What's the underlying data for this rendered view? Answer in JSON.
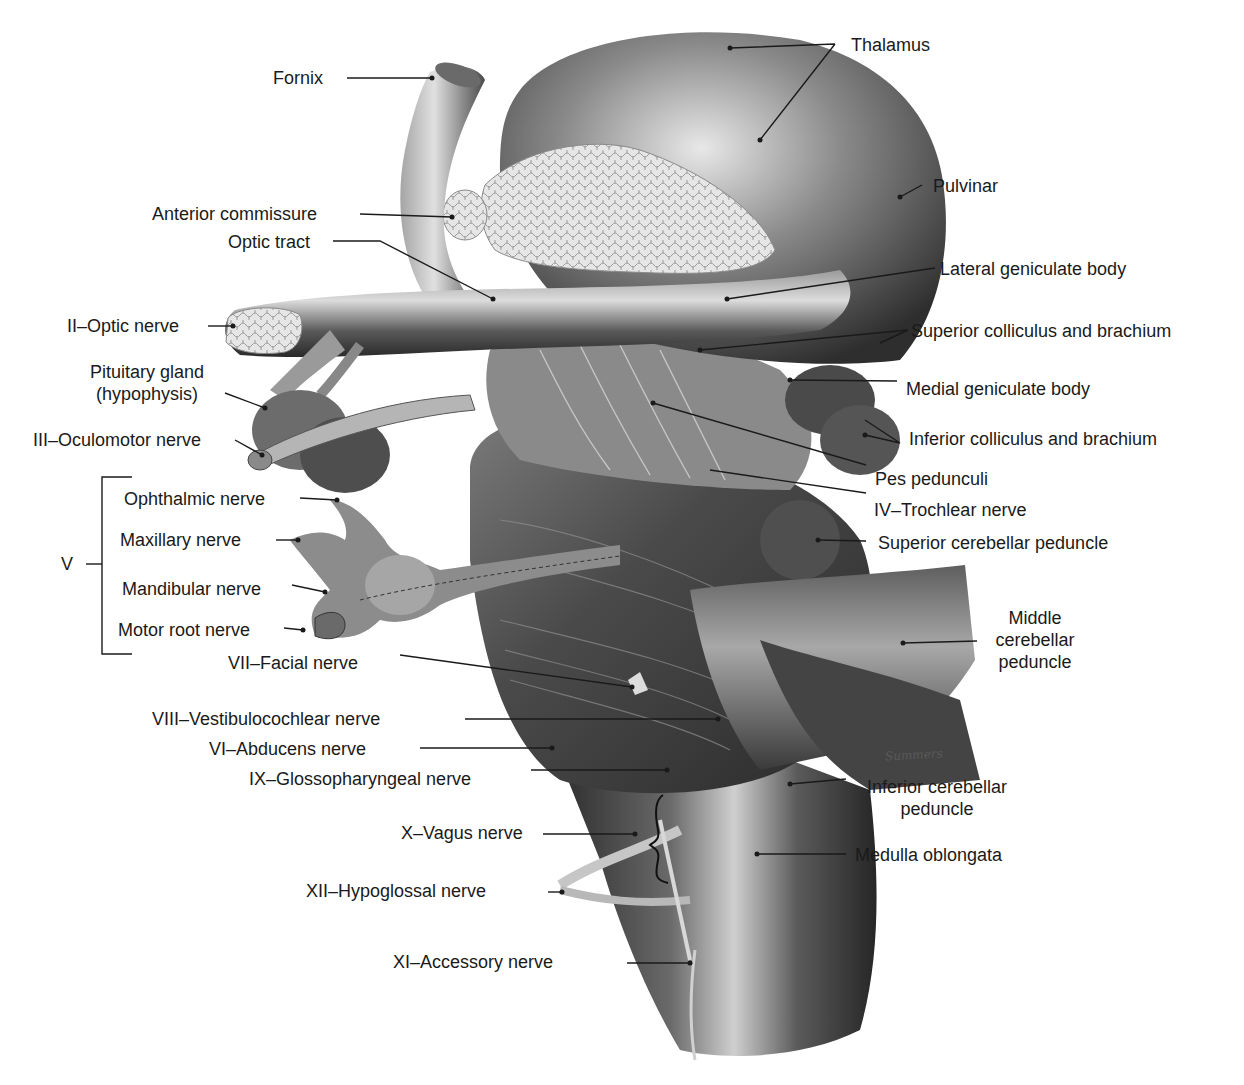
{
  "figure": {
    "signature": "Summers"
  },
  "labels": {
    "thalamus": "Thalamus",
    "fornix": "Fornix",
    "pulvinar": "Pulvinar",
    "anterior_commissure": "Anterior commissure",
    "optic_tract": "Optic tract",
    "lateral_geniculate_body": "Lateral geniculate body",
    "optic_nerve": "II–Optic nerve",
    "superior_colliculus": "Superior colliculus and brachium",
    "pituitary_line1": "Pituitary gland",
    "pituitary_line2": "(hypophysis)",
    "medial_geniculate_body": "Medial geniculate body",
    "oculomotor_nerve": "III–Oculomotor nerve",
    "inferior_colliculus": "Inferior colliculus and brachium",
    "pes_pedunculi": "Pes pedunculi",
    "trigeminal_group": "V",
    "ophthalmic_nerve": "Ophthalmic nerve",
    "trochlear_nerve": "IV–Trochlear nerve",
    "maxillary_nerve": "Maxillary nerve",
    "superior_cerebellar_peduncle": "Superior cerebellar peduncle",
    "mandibular_nerve": "Mandibular nerve",
    "motor_root_nerve": "Motor root nerve",
    "middle_cp_line1": "Middle",
    "middle_cp_line2": "cerebellar",
    "middle_cp_line3": "peduncle",
    "facial_nerve": "VII–Facial nerve",
    "vestibulocochlear_nerve": "VIII–Vestibulocochlear nerve",
    "abducens_nerve": "VI–Abducens nerve",
    "glossopharyngeal_nerve": "IX–Glossopharyngeal nerve",
    "inferior_cp_line1": "Inferior cerebellar",
    "inferior_cp_line2": "peduncle",
    "vagus_nerve": "X–Vagus nerve",
    "medulla_oblongata": "Medulla oblongata",
    "hypoglossal_nerve": "XII–Hypoglossal nerve",
    "accessory_nerve": "XI–Accessory nerve"
  },
  "colors": {
    "ink": "#1a1a1a",
    "tissue_dark": "#3a3a3a",
    "tissue_mid": "#6e6e6e",
    "tissue_light": "#b8b8b8",
    "highlight": "#e4e4e4",
    "background": "#ffffff"
  }
}
